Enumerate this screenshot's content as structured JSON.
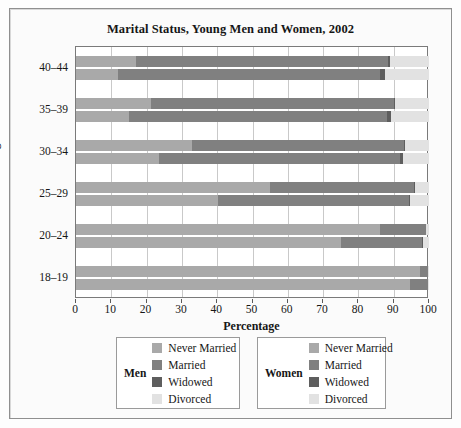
{
  "figure": {
    "title": "Marital Status, Young Men and Women, 2002"
  },
  "axes": {
    "x_title": "Percentage",
    "y_title": "Age",
    "x_ticks": [
      "0",
      "10",
      "20",
      "30",
      "40",
      "50",
      "60",
      "70",
      "80",
      "90",
      "100"
    ],
    "y_ticks": [
      "40–44",
      "35–39",
      "30–34",
      "25–29",
      "20–24",
      "18–19"
    ]
  },
  "legends": [
    {
      "title": "Men",
      "items": [
        {
          "label": "Never Married",
          "color": "#a9a9a9"
        },
        {
          "label": "Married",
          "color": "#808080"
        },
        {
          "label": "Widowed",
          "color": "#5e5e5e"
        },
        {
          "label": "Divorced",
          "color": "#e2e2e2"
        }
      ]
    },
    {
      "title": "Women",
      "items": [
        {
          "label": "Never Married",
          "color": "#a9a9a9"
        },
        {
          "label": "Married",
          "color": "#808080"
        },
        {
          "label": "Widowed",
          "color": "#5e5e5e"
        },
        {
          "label": "Divorced",
          "color": "#e2e2e2"
        }
      ]
    }
  ],
  "chart_data": {
    "type": "bar",
    "orientation": "horizontal",
    "stacked": true,
    "title": "Marital Status, Young Men and Women, 2002",
    "xlabel": "Percentage",
    "ylabel": "Age",
    "xlim": [
      0,
      100
    ],
    "xticks": [
      0,
      10,
      20,
      30,
      40,
      50,
      60,
      70,
      80,
      90,
      100
    ],
    "grid": "vertical",
    "legend_position": "below",
    "categories": [
      "40–44",
      "35–39",
      "30–34",
      "25–29",
      "20–24",
      "18–19"
    ],
    "status_order": [
      "Never Married",
      "Married",
      "Widowed",
      "Divorced"
    ],
    "colors": {
      "Never Married": "#a9a9a9",
      "Married": "#808080",
      "Widowed": "#5e5e5e",
      "Divorced": "#e2e2e2"
    },
    "groups": [
      {
        "category": "40–44",
        "bars": [
          {
            "sex": "Men",
            "values": {
              "Never Married": 17.0,
              "Married": 71.5,
              "Widowed": 0.4,
              "Divorced": 11.1
            }
          },
          {
            "sex": "Women",
            "values": {
              "Never Married": 11.8,
              "Married": 74.2,
              "Widowed": 1.6,
              "Divorced": 12.4
            }
          }
        ]
      },
      {
        "category": "35–39",
        "bars": [
          {
            "sex": "Men",
            "values": {
              "Never Married": 21.2,
              "Married": 68.8,
              "Widowed": 0.3,
              "Divorced": 9.7
            }
          },
          {
            "sex": "Women",
            "values": {
              "Never Married": 15.1,
              "Married": 73.1,
              "Widowed": 1.1,
              "Divorced": 10.7
            }
          }
        ]
      },
      {
        "category": "30–34",
        "bars": [
          {
            "sex": "Men",
            "values": {
              "Never Married": 33.0,
              "Married": 59.9,
              "Widowed": 0.2,
              "Divorced": 6.9
            }
          },
          {
            "sex": "Women",
            "values": {
              "Never Married": 23.4,
              "Married": 68.3,
              "Widowed": 0.8,
              "Divorced": 7.5
            }
          }
        ]
      },
      {
        "category": "25–29",
        "bars": [
          {
            "sex": "Men",
            "values": {
              "Never Married": 55.0,
              "Married": 40.8,
              "Widowed": 0.1,
              "Divorced": 4.1
            }
          },
          {
            "sex": "Women",
            "values": {
              "Never Married": 40.2,
              "Married": 54.1,
              "Widowed": 0.4,
              "Divorced": 5.3
            }
          }
        ]
      },
      {
        "category": "20–24",
        "bars": [
          {
            "sex": "Men",
            "values": {
              "Never Married": 86.0,
              "Married": 13.1,
              "Widowed": 0.1,
              "Divorced": 0.8
            }
          },
          {
            "sex": "Women",
            "values": {
              "Never Married": 75.0,
              "Married": 23.0,
              "Widowed": 0.2,
              "Divorced": 1.8
            }
          }
        ]
      },
      {
        "category": "18–19",
        "bars": [
          {
            "sex": "Men",
            "values": {
              "Never Married": 97.4,
              "Married": 2.4,
              "Widowed": 0.0,
              "Divorced": 0.2
            }
          },
          {
            "sex": "Women",
            "values": {
              "Never Married": 94.6,
              "Married": 5.0,
              "Widowed": 0.0,
              "Divorced": 0.4
            }
          }
        ]
      }
    ]
  }
}
